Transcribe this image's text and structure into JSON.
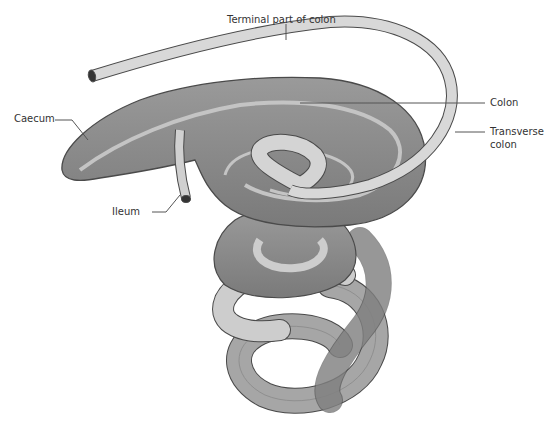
{
  "diagram": {
    "type": "anatomical-illustration",
    "colors": {
      "gut_dark": "#8a8a8a",
      "gut_mid": "#a6a6a6",
      "gut_light": "#c8c8c8",
      "tube_light": "#dcdcdc",
      "outline": "#4a4a4a",
      "leader_line": "#555555",
      "text": "#333333"
    },
    "labels": {
      "terminal_colon": "Terminal part of colon",
      "colon": "Colon",
      "transverse_line1": "Transverse",
      "transverse_line2": "colon",
      "caecum": "Caecum",
      "ileum": "Ileum"
    }
  }
}
